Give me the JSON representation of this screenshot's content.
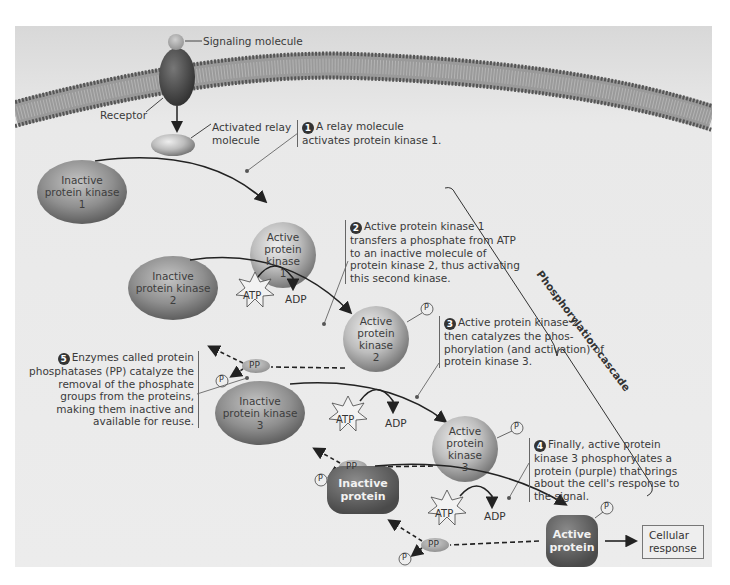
{
  "labels": {
    "signaling_molecule": "Signaling molecule",
    "receptor": "Receptor",
    "activated_relay_line1": "Activated relay",
    "activated_relay_line2": "molecule",
    "atp": "ATP",
    "adp": "ADP",
    "pp": "PP",
    "p": "P",
    "pi_sub": "i",
    "cellular_response_line1": "Cellular",
    "cellular_response_line2": "response",
    "phosphorylation_cascade": "Phosphorylation cascade"
  },
  "molecules": {
    "inactive_pk1": [
      "Inactive",
      "protein kinase",
      "1"
    ],
    "active_pk1": [
      "Active",
      "protein",
      "kinase",
      "1"
    ],
    "inactive_pk2": [
      "Inactive",
      "protein kinase",
      "2"
    ],
    "active_pk2": [
      "Active",
      "protein",
      "kinase",
      "2"
    ],
    "inactive_pk3": [
      "Inactive",
      "protein kinase",
      "3"
    ],
    "active_pk3": [
      "Active",
      "protein",
      "kinase",
      "3"
    ],
    "inactive_protein": [
      "Inactive",
      "protein"
    ],
    "active_protein": [
      "Active",
      "protein"
    ]
  },
  "steps": [
    {
      "num": "1",
      "lines": [
        "A relay molecule",
        "activates protein kinase 1."
      ]
    },
    {
      "num": "2",
      "lines": [
        "Active protein kinase 1",
        "transfers a phosphate from ATP",
        "to an inactive molecule of",
        "protein kinase 2, thus activating",
        "this second kinase."
      ]
    },
    {
      "num": "3",
      "lines": [
        "Active protein kinase 2",
        "then catalyzes the phos-",
        "phorylation (and activation) of",
        "protein kinase 3."
      ]
    },
    {
      "num": "4",
      "lines": [
        "Finally, active protein",
        "kinase 3 phosphorylates a",
        "protein (purple) that brings",
        "about the cell's response to",
        "the signal."
      ]
    },
    {
      "num": "5",
      "lines": [
        "Enzymes called protein",
        "phosphatases (PP) catalyze the",
        "removal of the phosphate",
        "groups from the proteins,",
        "making them inactive and",
        "available for reuse."
      ]
    }
  ],
  "colors": {
    "panel_bg": "#e9e9e9",
    "membrane": "#8a8a8a",
    "kinase_dark": "#6e6e6e",
    "kinase_light": "#b5b5b5",
    "protein": "#5a5a5a",
    "text": "#333333"
  }
}
